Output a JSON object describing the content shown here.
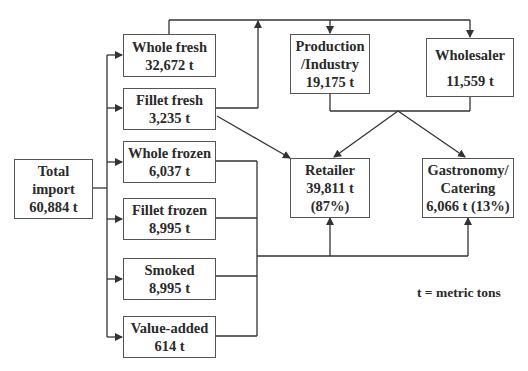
{
  "diagram": {
    "nodes": {
      "total_import": {
        "line1": "Total",
        "line2": "import",
        "line3": "60,884 t"
      },
      "whole_fresh": {
        "line1": "Whole fresh",
        "line2": "32,672 t"
      },
      "fillet_fresh": {
        "line1": "Fillet fresh",
        "line2": "3,235 t"
      },
      "whole_frozen": {
        "line1": "Whole frozen",
        "line2": "6,037 t"
      },
      "fillet_frozen": {
        "line1": "Fillet frozen",
        "line2": "8,995 t"
      },
      "smoked": {
        "line1": "Smoked",
        "line2": "8,995 t"
      },
      "value_added": {
        "line1": "Value-added",
        "line2": "614 t"
      },
      "production": {
        "line1": "Production",
        "line2": "/Industry",
        "line3": "19,175 t"
      },
      "wholesaler": {
        "line1": "Wholesaler",
        "line2": "11,559 t"
      },
      "retailer": {
        "line1": "Retailer",
        "line2": "39,811 t",
        "line3": "(87%)"
      },
      "gastronomy": {
        "line1": "Gastronomy/",
        "line2": "Catering",
        "line3": "6,066 t (13%)"
      }
    },
    "edges": [
      {
        "from": "total_import",
        "to": "whole_fresh"
      },
      {
        "from": "total_import",
        "to": "fillet_fresh"
      },
      {
        "from": "total_import",
        "to": "whole_frozen"
      },
      {
        "from": "total_import",
        "to": "fillet_frozen"
      },
      {
        "from": "total_import",
        "to": "smoked"
      },
      {
        "from": "total_import",
        "to": "value_added"
      },
      {
        "from": "whole_fresh",
        "to": "production"
      },
      {
        "from": "whole_fresh",
        "to": "wholesaler"
      },
      {
        "from": "fillet_fresh",
        "to": "production"
      },
      {
        "from": "fillet_fresh",
        "to": "wholesaler"
      },
      {
        "from": "fillet_fresh",
        "to": "retailer"
      },
      {
        "from": "production",
        "to": "retailer"
      },
      {
        "from": "production",
        "to": "gastronomy"
      },
      {
        "from": "wholesaler",
        "to": "retailer"
      },
      {
        "from": "wholesaler",
        "to": "gastronomy"
      },
      {
        "from": "whole_frozen",
        "to": "retailer"
      },
      {
        "from": "whole_frozen",
        "to": "gastronomy"
      },
      {
        "from": "fillet_frozen",
        "to": "retailer"
      },
      {
        "from": "fillet_frozen",
        "to": "gastronomy"
      },
      {
        "from": "smoked",
        "to": "retailer"
      },
      {
        "from": "smoked",
        "to": "gastronomy"
      },
      {
        "from": "value_added",
        "to": "retailer"
      },
      {
        "from": "value_added",
        "to": "gastronomy"
      }
    ],
    "legend": "t = metric tons",
    "line_color": "#333333"
  }
}
